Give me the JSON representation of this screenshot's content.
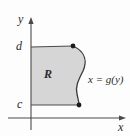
{
  "figure": {
    "background_color": "#fdfdfd",
    "axis_color": "#4a4a4a",
    "curve_color": "#3a3a3a",
    "region_fill_color": "#d6d6d6",
    "text_color": "#2b2b2b"
  },
  "axes": {
    "y_axis_label": "y",
    "x_axis_label": "x",
    "y_axis_x_position": 31,
    "x_axis_y_position": 118,
    "y_axis_top": 18,
    "x_axis_right": 126
  },
  "ticks": {
    "upper_label": "d",
    "lower_label": "c",
    "upper_y_position": 47,
    "lower_y_position": 105
  },
  "region": {
    "label": "R",
    "fill": "#d6d6d6",
    "left_boundary_x": 31,
    "top_boundary_y": 47,
    "bottom_boundary_y": 105
  },
  "curve": {
    "label": "x = g(y)",
    "shape": "s-curve",
    "top_endpoint": {
      "x": 73,
      "y": 46
    },
    "bottom_endpoint": {
      "x": 79,
      "y": 105
    },
    "max_bulge_x": 85,
    "min_waist_x": 76
  },
  "endpoints": [
    {
      "name": "top-endpoint",
      "x": 73,
      "y": 46
    },
    {
      "name": "bottom-endpoint",
      "x": 79,
      "y": 105
    }
  ]
}
